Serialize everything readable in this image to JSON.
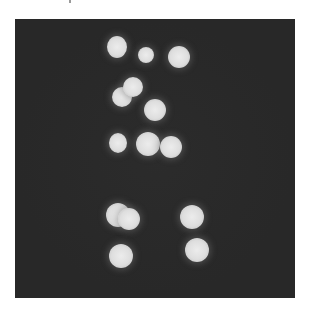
{
  "image": {
    "description": "Fluorescence microscopy-style image of bright round spots on a dark background",
    "background_color": "#282828",
    "spot_color": "#e2e2e2",
    "spots": [
      {
        "cx": 117,
        "cy": 47,
        "rx": 10,
        "ry": 11
      },
      {
        "cx": 146,
        "cy": 55,
        "rx": 8,
        "ry": 8
      },
      {
        "cx": 179,
        "cy": 57,
        "rx": 11,
        "ry": 11
      },
      {
        "cx": 122,
        "cy": 97,
        "rx": 10,
        "ry": 10
      },
      {
        "cx": 133,
        "cy": 87,
        "rx": 10,
        "ry": 10
      },
      {
        "cx": 155,
        "cy": 110,
        "rx": 11,
        "ry": 11
      },
      {
        "cx": 118,
        "cy": 143,
        "rx": 9,
        "ry": 10
      },
      {
        "cx": 148,
        "cy": 144,
        "rx": 12,
        "ry": 12
      },
      {
        "cx": 171,
        "cy": 147,
        "rx": 11,
        "ry": 11
      },
      {
        "cx": 118,
        "cy": 215,
        "rx": 12,
        "ry": 12
      },
      {
        "cx": 129,
        "cy": 219,
        "rx": 11,
        "ry": 11
      },
      {
        "cx": 192,
        "cy": 217,
        "rx": 12,
        "ry": 12
      },
      {
        "cx": 121,
        "cy": 256,
        "rx": 12,
        "ry": 12
      },
      {
        "cx": 197,
        "cy": 250,
        "rx": 12,
        "ry": 12
      }
    ]
  }
}
